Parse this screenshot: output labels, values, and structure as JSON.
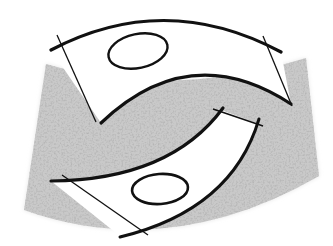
{
  "figure": {
    "colors": {
      "background": "#ffffff",
      "sector_fill": "#c9c9c9",
      "sector_speckle": "#8a8a8a",
      "banner_fill": "#ffffff",
      "stroke": "#111111"
    },
    "sector": {
      "path": "M 46 64 Q 170 100 306 58 L 319 176 Q 170 262 24 210 Z"
    },
    "upper_banner": {
      "path": "M 51 50 Q 165 -10 281 52 L 291 104 Q 190 38 101 123 Z",
      "outer_arc": "M 51 50 Q 165 -10 281 52",
      "inner_arc": "M 101 123 Q 190 38 291 104",
      "left_edge": [
        57,
        35,
        96,
        122
      ],
      "right_edge": [
        263,
        36,
        292,
        106
      ],
      "ellipse": {
        "cx": 138,
        "cy": 51,
        "rx": 30,
        "ry": 17,
        "rotate": -12
      }
    },
    "lower_banner": {
      "path": "M 51 181 Q 170 180 221 110 L 259 124 Q 230 210 121 237 Z",
      "top_arc": "M 51 181 Q 170 180 223 108",
      "bottom_arc": "M 259 119 Q 232 210 120 237",
      "top_right_edge": [
        213,
        109,
        263,
        126
      ],
      "left_edge": [
        62,
        175,
        148,
        235
      ],
      "ellipse": {
        "cx": 160,
        "cy": 189,
        "rx": 28,
        "ry": 15,
        "rotate": -4
      }
    }
  }
}
